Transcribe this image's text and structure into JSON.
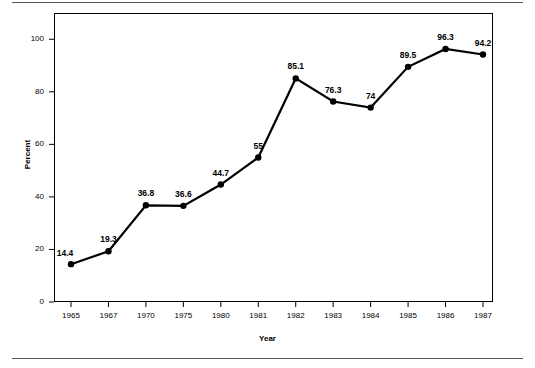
{
  "chart_data": {
    "type": "line",
    "title": "",
    "subtitle": "",
    "xlabel": "Year",
    "ylabel": "Percent",
    "categories": [
      "1965",
      "1967",
      "1970",
      "1975",
      "1980",
      "1981",
      "1982",
      "1983",
      "1984",
      "1985",
      "1986",
      "1987"
    ],
    "values": [
      14.4,
      19.3,
      36.8,
      36.6,
      44.7,
      55,
      85.1,
      76.3,
      74,
      89.5,
      96.3,
      94.2
    ],
    "point_labels": [
      "14.4",
      "19.3",
      "36.8",
      "36.6",
      "44.7",
      "55",
      "85.1",
      "76.3",
      "74",
      "89.5",
      "96.3",
      "94.2"
    ],
    "ylim": [
      0,
      110
    ],
    "xlim": [
      0,
      11
    ],
    "yticks": [
      0,
      20,
      40,
      60,
      80,
      100
    ],
    "ytick_labels": [
      "0",
      "20",
      "40",
      "60",
      "80",
      "100"
    ],
    "grid": false,
    "legend": "none",
    "series_color": "#000000",
    "marker": "circle",
    "marker_color": "#000000"
  },
  "figure": {
    "background_color": "#ffffff",
    "frame_color": "#000000",
    "rule_color": "#555555",
    "has_top_rule": true,
    "has_bottom_rule": true
  }
}
